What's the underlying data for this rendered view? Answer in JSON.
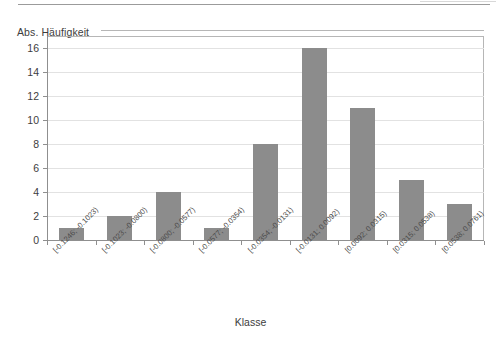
{
  "chart_data": {
    "type": "bar",
    "title": "",
    "xlabel": "Klasse",
    "ylabel": "Abs. Häufigkeit",
    "ylim": [
      0,
      17
    ],
    "yticks": [
      0,
      2,
      4,
      6,
      8,
      10,
      12,
      14,
      16
    ],
    "grid": true,
    "legend": null,
    "bar_color": "#8c8c8c",
    "categories": [
      "[-0.1246; -0.1023)",
      "[-0.1023; -0.0800)",
      "[-0.0800; -0.0577)",
      "[-0.0577; -0.0354)",
      "[-0.0354; -0.0131)",
      "[-0.0131; 0.0092)",
      "[0.0092; 0.0315)",
      "[0.0315; 0.0538)",
      "[0.0538; 0.0761)"
    ],
    "values": [
      1,
      2,
      4,
      1,
      8,
      16,
      11,
      5,
      3
    ]
  },
  "axes": {
    "y_title": "Abs. Häufigkeit",
    "x_title": "Klasse",
    "y_tick_labels": [
      "16",
      "14",
      "12",
      "10",
      "8",
      "6",
      "4",
      "2",
      "0"
    ]
  }
}
